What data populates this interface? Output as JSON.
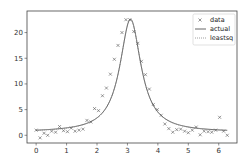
{
  "chart_data": {
    "type": "line",
    "title": "",
    "xlabel": "",
    "ylabel": "",
    "xlim": [
      -0.3,
      6.6
    ],
    "ylim": [
      -1.5,
      24.2
    ],
    "grid": false,
    "legend_position": "top-right",
    "xticks": [
      0,
      1,
      2,
      3,
      4,
      5,
      6
    ],
    "yticks": [
      0,
      5,
      10,
      15,
      20
    ],
    "xtick_labels": [
      "0",
      "1",
      "2",
      "3",
      "4",
      "5",
      "6"
    ],
    "ytick_labels": [
      "0",
      "5",
      "10",
      "15",
      "20"
    ],
    "legend": [
      {
        "label": "data",
        "marker": "x"
      },
      {
        "label": "actual",
        "style": "solid"
      },
      {
        "label": "leastsq",
        "style": "dotted"
      }
    ],
    "series": [
      {
        "name": "data",
        "kind": "scatter",
        "marker": "x",
        "color": "#555555",
        "x": [
          0.0,
          0.13,
          0.26,
          0.38,
          0.51,
          0.64,
          0.77,
          0.9,
          1.03,
          1.15,
          1.28,
          1.41,
          1.54,
          1.67,
          1.8,
          1.92,
          2.05,
          2.18,
          2.31,
          2.44,
          2.57,
          2.69,
          2.82,
          2.95,
          3.08,
          3.21,
          3.34,
          3.46,
          3.59,
          3.72,
          3.85,
          3.98,
          4.11,
          4.23,
          4.36,
          4.49,
          4.62,
          4.75,
          4.88,
          5.0,
          5.13,
          5.26,
          5.39,
          5.52,
          5.65,
          5.77,
          5.9,
          6.03,
          6.16,
          6.28
        ],
        "y": [
          1.0,
          -0.5,
          0.4,
          0.0,
          0.8,
          0.6,
          1.7,
          0.9,
          0.7,
          1.4,
          0.8,
          1.0,
          1.2,
          2.9,
          2.6,
          5.2,
          4.8,
          7.7,
          9.2,
          11.9,
          14.8,
          17.5,
          20.0,
          22.5,
          22.5,
          20.2,
          17.9,
          14.4,
          11.8,
          9.0,
          6.0,
          5.0,
          3.9,
          2.2,
          1.3,
          0.6,
          1.1,
          1.2,
          0.8,
          0.5,
          1.0,
          1.6,
          0.1,
          0.8,
          0.7,
          0.6,
          1.0,
          3.5,
          0.8,
          0.0
        ]
      },
      {
        "name": "actual",
        "kind": "line",
        "style": "solid",
        "color": "#555555",
        "function": "lorentzian",
        "params": {
          "amplitude": 22.0,
          "center": 3.1,
          "width": 0.42,
          "baseline": 0.6
        },
        "x_range": [
          0,
          6.28
        ]
      },
      {
        "name": "leastsq",
        "kind": "line",
        "style": "dotted",
        "color": "#888888",
        "function": "lorentzian",
        "params": {
          "amplitude": 22.1,
          "center": 3.1,
          "width": 0.42,
          "baseline": 0.55
        },
        "x_range": [
          0,
          6.28
        ]
      }
    ]
  }
}
